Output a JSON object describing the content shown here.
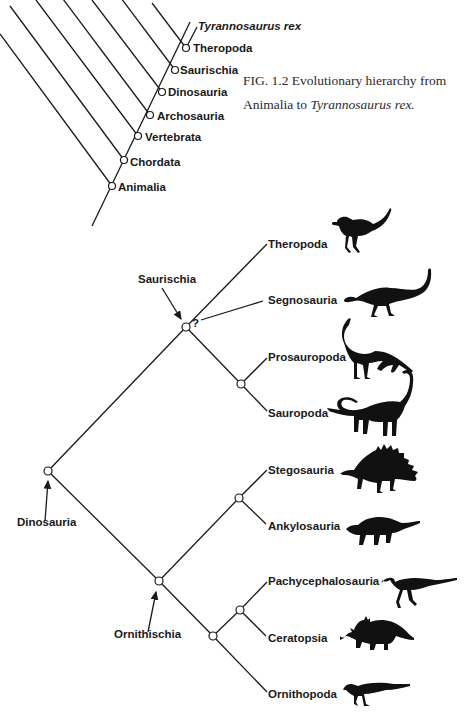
{
  "figure": {
    "number": "FIG. 1.2",
    "caption_text": "Evolutionary hierarchy from Animalia to",
    "caption_italic": "Tyrannosaurus rex.",
    "caption_line1": "FIG. 1.2  Evolutionary hierarchy from",
    "caption_line2_prefix": "Animalia to "
  },
  "top_cladogram": {
    "apex_label": "Tyrannosaurus rex",
    "nodes": [
      "Theropoda",
      "Saurischia",
      "Dinosauria",
      "Archosauria",
      "Vertebrata",
      "Chordata",
      "Animalia"
    ]
  },
  "dinosaur_tree": {
    "root": "Dinosauria",
    "clades": {
      "saurischia": "Saurischia",
      "ornithischia": "Ornithischia",
      "uncertain_mark": "?"
    },
    "tips": [
      {
        "label": "Theropoda",
        "silhouette": "theropod-silhouette"
      },
      {
        "label": "Segnosauria",
        "silhouette": "segnosaur-silhouette"
      },
      {
        "label": "Prosauropoda",
        "silhouette": "prosauropod-silhouette"
      },
      {
        "label": "Sauropoda",
        "silhouette": "sauropod-silhouette"
      },
      {
        "label": "Stegosauria",
        "silhouette": "stegosaur-silhouette"
      },
      {
        "label": "Ankylosauria",
        "silhouette": "ankylosaur-silhouette"
      },
      {
        "label": "Pachycephalosauria",
        "silhouette": "pachycephalosaur-silhouette"
      },
      {
        "label": "Ceratopsia",
        "silhouette": "ceratopsian-silhouette"
      },
      {
        "label": "Ornithopoda",
        "silhouette": "ornithopod-silhouette"
      }
    ]
  }
}
